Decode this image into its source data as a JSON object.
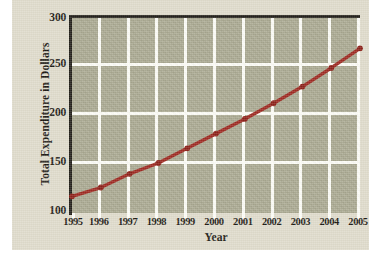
{
  "chart_data": {
    "type": "line",
    "title": "",
    "xlabel": "Year",
    "ylabel": "Total Expenditure in Dollars",
    "x": [
      1995,
      1996,
      1997,
      1998,
      1999,
      2000,
      2001,
      2002,
      2003,
      2004,
      2005
    ],
    "xtick_labels": [
      "1995",
      "1996",
      "1997",
      "1998",
      "1999",
      "2000",
      "2001",
      "2002",
      "2003",
      "2004",
      "2005"
    ],
    "values": [
      117,
      126,
      140,
      151,
      166,
      181,
      196,
      212,
      229,
      248,
      268
    ],
    "series": [
      {
        "name": "Total Expenditure",
        "values": [
          117,
          126,
          140,
          151,
          166,
          181,
          196,
          212,
          229,
          248,
          268
        ]
      }
    ],
    "ylim": [
      100,
      300
    ],
    "xlim": [
      1995,
      2005
    ],
    "ytick_labels": [
      "100",
      "150",
      "200",
      "250",
      "300"
    ],
    "yticks": [
      100,
      150,
      200,
      250,
      300
    ],
    "grid": true,
    "legend": "none",
    "colors": {
      "line": "#9e2a22",
      "marker": "#8c2119",
      "plot_background": "#a9a890",
      "gridline": "#fdfdf7",
      "axis": "#23201a",
      "paper_background": "#dfdbcb",
      "text": "#1d1a14"
    },
    "marker": "circle",
    "line_width": 3
  }
}
